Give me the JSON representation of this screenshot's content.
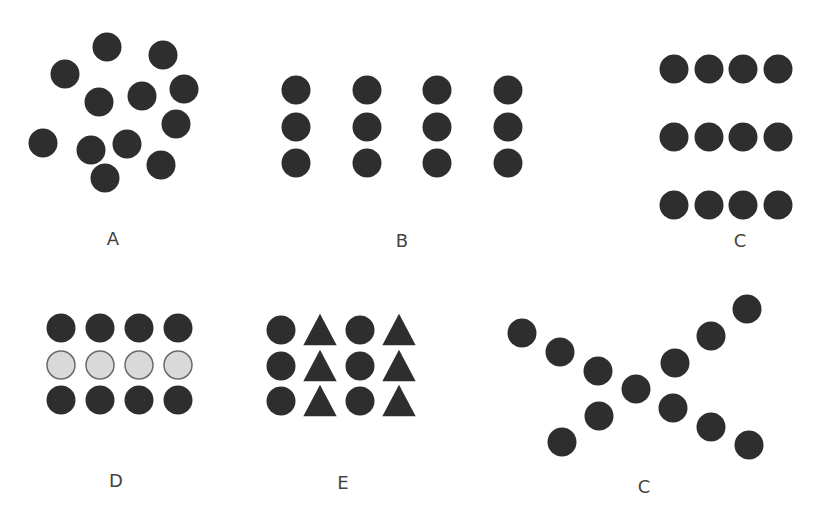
{
  "figure": {
    "colors": {
      "dark": "#2f2f2f",
      "light_fill": "#d9d9d9",
      "light_stroke": "#6a6a6a",
      "label": "#444444"
    },
    "radius": 14.5,
    "panels": [
      {
        "id": "A",
        "label": "A",
        "label_pos": [
          113,
          238
        ],
        "description": "Random scatter of dots",
        "shapes": [
          {
            "type": "circle",
            "x": 107,
            "y": 47,
            "fill": "dark"
          },
          {
            "type": "circle",
            "x": 163,
            "y": 55,
            "fill": "dark"
          },
          {
            "type": "circle",
            "x": 65,
            "y": 74,
            "fill": "dark"
          },
          {
            "type": "circle",
            "x": 99,
            "y": 102,
            "fill": "dark"
          },
          {
            "type": "circle",
            "x": 142,
            "y": 96,
            "fill": "dark"
          },
          {
            "type": "circle",
            "x": 184,
            "y": 89,
            "fill": "dark"
          },
          {
            "type": "circle",
            "x": 176,
            "y": 124,
            "fill": "dark"
          },
          {
            "type": "circle",
            "x": 43,
            "y": 143,
            "fill": "dark"
          },
          {
            "type": "circle",
            "x": 91,
            "y": 150,
            "fill": "dark"
          },
          {
            "type": "circle",
            "x": 127,
            "y": 144,
            "fill": "dark"
          },
          {
            "type": "circle",
            "x": 161,
            "y": 165,
            "fill": "dark"
          },
          {
            "type": "circle",
            "x": 105,
            "y": 178,
            "fill": "dark"
          }
        ]
      },
      {
        "id": "B",
        "label": "B",
        "label_pos": [
          402,
          240
        ],
        "description": "Dots grouped into vertical columns (proximity)",
        "grid": {
          "xs": [
            296,
            367,
            437,
            508
          ],
          "ys": [
            90,
            127,
            163
          ],
          "pattern": [
            "circle"
          ],
          "row_fills": [
            "dark",
            "dark",
            "dark"
          ]
        }
      },
      {
        "id": "C1",
        "label": "C",
        "label_pos": [
          740,
          240
        ],
        "description": "Dots grouped into horizontal rows (proximity)",
        "grid": {
          "xs": [
            674,
            709,
            743,
            778
          ],
          "ys": [
            69,
            137,
            205
          ],
          "pattern": [
            "circle"
          ],
          "row_fills": [
            "dark",
            "dark",
            "dark"
          ]
        }
      },
      {
        "id": "D",
        "label": "D",
        "label_pos": [
          116,
          480
        ],
        "description": "Rows grouped by similarity of color",
        "grid": {
          "xs": [
            61,
            100,
            139,
            178
          ],
          "ys": [
            328,
            365,
            400
          ],
          "pattern": [
            "circle"
          ],
          "row_fills": [
            "dark",
            "light",
            "dark"
          ]
        }
      },
      {
        "id": "E",
        "label": "E",
        "label_pos": [
          343,
          482
        ],
        "description": "Columns grouped by similarity of shape",
        "grid": {
          "xs": [
            281,
            320,
            360,
            399
          ],
          "ys": [
            330,
            366,
            401
          ],
          "pattern": [
            "circle",
            "triangle",
            "circle",
            "triangle"
          ],
          "row_fills": [
            "dark",
            "dark",
            "dark"
          ]
        }
      },
      {
        "id": "C2",
        "label": "C",
        "label_pos": [
          644,
          486
        ],
        "description": "Dots forming two crossing lines (continuity)",
        "shapes": [
          {
            "type": "circle",
            "x": 522,
            "y": 333,
            "fill": "dark"
          },
          {
            "type": "circle",
            "x": 560,
            "y": 352,
            "fill": "dark"
          },
          {
            "type": "circle",
            "x": 598,
            "y": 371,
            "fill": "dark"
          },
          {
            "type": "circle",
            "x": 636,
            "y": 389,
            "fill": "dark"
          },
          {
            "type": "circle",
            "x": 673,
            "y": 408,
            "fill": "dark"
          },
          {
            "type": "circle",
            "x": 711,
            "y": 427,
            "fill": "dark"
          },
          {
            "type": "circle",
            "x": 749,
            "y": 445,
            "fill": "dark"
          },
          {
            "type": "circle",
            "x": 562,
            "y": 442,
            "fill": "dark"
          },
          {
            "type": "circle",
            "x": 599,
            "y": 416,
            "fill": "dark"
          },
          {
            "type": "circle",
            "x": 675,
            "y": 363,
            "fill": "dark"
          },
          {
            "type": "circle",
            "x": 711,
            "y": 336,
            "fill": "dark"
          },
          {
            "type": "circle",
            "x": 747,
            "y": 309,
            "fill": "dark"
          }
        ]
      }
    ]
  }
}
